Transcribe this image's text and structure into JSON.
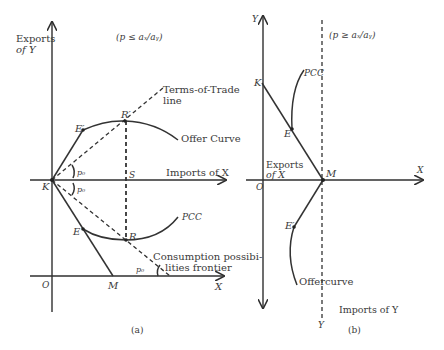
{
  "figure": {
    "panels": [
      {
        "id": "a",
        "caption": "(a)",
        "condition": "(p ≤ aₓ/aᵧ)",
        "axes": {
          "y_label_line1": "Exports",
          "y_label_line2": "of Y",
          "x_label_upper": "Imports of X",
          "x_label_lower": "X",
          "origin": "O"
        },
        "points": {
          "K": "K",
          "E_prime": "E′",
          "R_prime": "R′",
          "S": "S",
          "E": "E",
          "R": "R",
          "M": "M"
        },
        "angles": {
          "upper": "p₀",
          "lower": "p₀",
          "frontier": "p₀"
        },
        "curves": {
          "tot_line_1": "Terms-of-Trade",
          "tot_line_2": "line",
          "offer_curve": "Offer Curve",
          "pcc": "PCC",
          "cpf_1": "Consumption possibi-",
          "cpf_2": "lities frontier"
        }
      },
      {
        "id": "b",
        "caption": "(b)",
        "condition": "(p ≥ aₓ/aᵧ)",
        "axes": {
          "y_top": "Y",
          "x_right": "X",
          "origin": "O",
          "exports_1": "Exports",
          "exports_2": "of X",
          "imports_y": "Imports of Y",
          "y_bottom": "Y"
        },
        "points": {
          "K": "K",
          "E": "E",
          "M": "M",
          "E_prime": "E′"
        },
        "curves": {
          "pcc": "PCC",
          "offer_1": "Offer",
          "offer_2": "curve"
        }
      }
    ]
  }
}
